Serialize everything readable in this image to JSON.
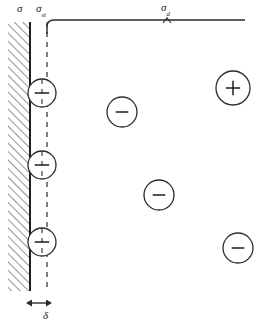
{
  "figure": {
    "type": "schematic-diagram",
    "title": "",
    "stroke_color": "#2b2b2b",
    "background_color": "#ffffff"
  },
  "labels": {
    "sigma": {
      "symbol": "σ",
      "subscript": ""
    },
    "sigma_st": {
      "symbol": "σ",
      "subscript": "st"
    },
    "sigma_d": {
      "symbol": "σ",
      "subscript": "d"
    },
    "delta": {
      "symbol": "δ",
      "subscript": ""
    }
  },
  "wall": {
    "name": "hatched-boundary-wall",
    "x_left": 8,
    "x_right": 30,
    "y_top": 22,
    "y_bottom": 291,
    "hatch_angle_deg": 45,
    "hatch_spacing": 6
  },
  "dashed_line": {
    "name": "slip-plane-dashed-line",
    "x": 47,
    "y_top": 22,
    "y_bottom": 287,
    "dash": "5,5"
  },
  "top_line": {
    "name": "stress-bracket-line",
    "x_start": 47,
    "x_end": 245,
    "y": 20,
    "elbow_radius": 7
  },
  "sigma_d_tick": {
    "x": 167,
    "y": 20,
    "height": 4
  },
  "delta_arrow": {
    "name": "delta-dimension-arrow",
    "x_start": 31,
    "x_end": 47,
    "y": 303
  },
  "wall_dislocations": [
    {
      "id": "wd1",
      "sign": "−",
      "cx": 42,
      "cy": 93,
      "r": 14
    },
    {
      "id": "wd2",
      "sign": "−",
      "cx": 42,
      "cy": 165,
      "r": 14
    },
    {
      "id": "wd3",
      "sign": "−",
      "cx": 42,
      "cy": 242,
      "r": 14
    }
  ],
  "free_dislocations": [
    {
      "id": "fd1",
      "sign": "−",
      "cx": 122,
      "cy": 112,
      "r": 15
    },
    {
      "id": "fd2",
      "sign": "+",
      "cx": 233,
      "cy": 88,
      "r": 17
    },
    {
      "id": "fd3",
      "sign": "−",
      "cx": 159,
      "cy": 195,
      "r": 15
    },
    {
      "id": "fd4",
      "sign": "−",
      "cx": 238,
      "cy": 248,
      "r": 15
    }
  ]
}
